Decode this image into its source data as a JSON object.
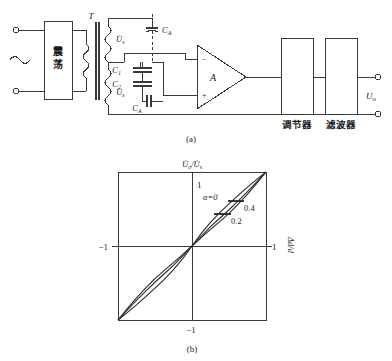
{
  "figure": {
    "panel_a": {
      "caption": "(a)",
      "oscillator_label": "震荡",
      "transformer_label": "T",
      "winding_upper_label": "U̇",
      "winding_upper_sub": "s",
      "winding_lower_label": "U̇",
      "winding_lower_sub": "s",
      "cap_top_label": "C",
      "cap_top_sub": "A",
      "cap_bottom_label": "C",
      "cap_bottom_sub": "A",
      "cap_series_1_label": "C",
      "cap_series_1_sub": "1",
      "cap_series_2_label": "C",
      "cap_series_2_sub": "2",
      "opamp_label": "A",
      "opamp_minus": "−",
      "opamp_plus": "+",
      "block_regulator": "调节器",
      "block_filter": "滤波器",
      "output_label": "U",
      "output_sub": "o",
      "ac_source_symbol": "∼"
    },
    "panel_b": {
      "caption": "(b)",
      "ylabel": "U̇ₒ/U̇ₛ",
      "ylabel_main": "U̇",
      "ylabel_sub1": "o",
      "ylabel_slash": "/",
      "ylabel_main2": "U̇",
      "ylabel_sub2": "s",
      "xlabel": "Δd/d",
      "tick_y_top": "1",
      "tick_y_bottom": "−1",
      "tick_x_left": "−1",
      "tick_x_right": "1",
      "annotation_alpha": "α=0",
      "annotation_04": "0.4",
      "annotation_02": "0.2"
    }
  },
  "chart_data": {
    "type": "line",
    "title": "",
    "xlabel": "Δd/d",
    "ylabel": "U̇o/U̇s",
    "xlim": [
      -1,
      1
    ],
    "ylim": [
      -1,
      1
    ],
    "xticks": [
      -1,
      1
    ],
    "yticks": [
      -1,
      1
    ],
    "grid": false,
    "legend_position": "inside-annotations",
    "series": [
      {
        "name": "α=0",
        "label": "α=0",
        "x": [
          -1,
          -0.875,
          -0.75,
          -0.625,
          -0.5,
          -0.375,
          -0.25,
          -0.125,
          0,
          0.125,
          0.25,
          0.375,
          0.5,
          0.625,
          0.75,
          0.875,
          1
        ],
        "values": [
          -1,
          -0.9,
          -0.795,
          -0.685,
          -0.57,
          -0.45,
          -0.32,
          -0.17,
          0,
          0.17,
          0.32,
          0.45,
          0.57,
          0.685,
          0.795,
          0.9,
          1
        ]
      },
      {
        "name": "α=0.2",
        "label": "0.2",
        "x": [
          -1,
          -0.875,
          -0.75,
          -0.625,
          -0.5,
          -0.375,
          -0.25,
          -0.125,
          0,
          0.125,
          0.25,
          0.375,
          0.5,
          0.625,
          0.75,
          0.875,
          1
        ],
        "values": [
          -1,
          -0.865,
          -0.735,
          -0.61,
          -0.49,
          -0.375,
          -0.262,
          -0.135,
          0,
          0.135,
          0.262,
          0.375,
          0.49,
          0.61,
          0.735,
          0.865,
          1
        ]
      },
      {
        "name": "α=0.4",
        "label": "0.4",
        "x": [
          -1,
          -0.875,
          -0.75,
          -0.625,
          -0.5,
          -0.375,
          -0.25,
          -0.125,
          0,
          0.125,
          0.25,
          0.375,
          0.5,
          0.625,
          0.75,
          0.875,
          1
        ],
        "values": [
          -1,
          -0.845,
          -0.7,
          -0.565,
          -0.44,
          -0.33,
          -0.225,
          -0.112,
          0,
          0.112,
          0.225,
          0.33,
          0.44,
          0.565,
          0.7,
          0.845,
          1
        ]
      }
    ]
  }
}
